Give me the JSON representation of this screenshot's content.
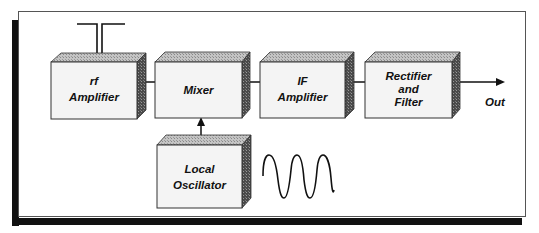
{
  "diagram": {
    "type": "block-diagram",
    "blocks": [
      {
        "id": "rf_amplifier",
        "label_line1": "rf",
        "label_line2": "Amplifier"
      },
      {
        "id": "mixer",
        "label_line1": "Mixer"
      },
      {
        "id": "if_amplifier",
        "label_line1": "IF",
        "label_line2": "Amplifier"
      },
      {
        "id": "rectifier_filter",
        "label_line1": "Rectifier",
        "label_line2": "and",
        "label_line3": "Filter"
      },
      {
        "id": "local_oscillator",
        "label_line1": "Local",
        "label_line2": "Oscillator"
      }
    ],
    "connections": [
      {
        "from": "antenna",
        "to": "rf_amplifier"
      },
      {
        "from": "rf_amplifier",
        "to": "mixer"
      },
      {
        "from": "mixer",
        "to": "if_amplifier"
      },
      {
        "from": "if_amplifier",
        "to": "rectifier_filter"
      },
      {
        "from": "local_oscillator",
        "to": "mixer",
        "arrow": true
      },
      {
        "from": "rectifier_filter",
        "to": "output",
        "arrow": true
      }
    ],
    "output_label": "Out",
    "icons": [
      "antenna-icon",
      "sine-wave-icon"
    ],
    "colors": {
      "box_face": "#f4f4f4",
      "box_top": "#b8b8b8",
      "box_side": "#555555",
      "shadow": "#111111",
      "line": "#111111"
    }
  }
}
